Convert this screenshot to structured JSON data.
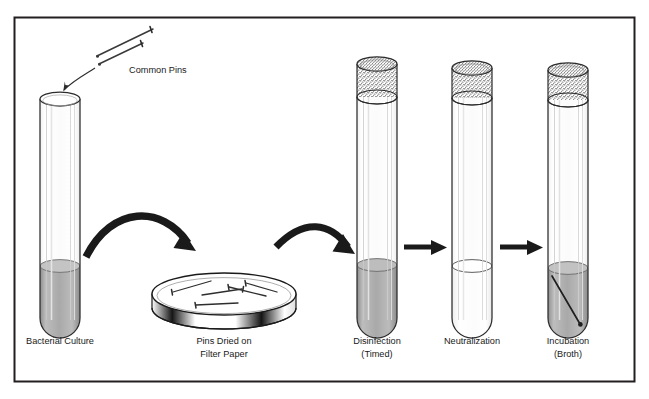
{
  "figure": {
    "border_color": "#231f20",
    "background_color": "#ffffff",
    "ink_color": "#231f20",
    "label_color": "#1a1a1a"
  },
  "labels": {
    "common_pins": "Common Pins",
    "bacterial_culture": "Bacterial Culture",
    "pins_dried_line1": "Pins Dried on",
    "pins_dried_line2": "Filter Paper",
    "disinfection_line1": "Disinfection",
    "disinfection_line2": "(Timed)",
    "neutralization": "Neutralization",
    "incubation_line1": "Incubation",
    "incubation_line2": "(Broth)"
  },
  "steps": [
    {
      "id": "bacterial-culture",
      "label": "Bacterial Culture",
      "vessel": "test-tube",
      "has_plug": false,
      "liquid": true,
      "liquid_color": "#b3b3b3",
      "liquid_level": "one-third",
      "has_pin_inside": false
    },
    {
      "id": "pins-dried",
      "label": "Pins Dried on Filter Paper",
      "vessel": "petri-dish",
      "pin_count": 5,
      "liquid": false
    },
    {
      "id": "disinfection",
      "label": "Disinfection (Timed)",
      "vessel": "test-tube",
      "has_plug": true,
      "liquid": true,
      "liquid_color": "#a8a8a8",
      "liquid_level": "one-third",
      "has_pin_inside": false
    },
    {
      "id": "neutralization",
      "label": "Neutralization",
      "vessel": "test-tube",
      "has_plug": true,
      "liquid": true,
      "liquid_color": "#fdfdfd",
      "liquid_level": "one-third",
      "has_pin_inside": false
    },
    {
      "id": "incubation",
      "label": "Incubation (Broth)",
      "vessel": "test-tube",
      "has_plug": true,
      "liquid": true,
      "liquid_color": "#b0b0b0",
      "liquid_level": "one-third",
      "has_pin_inside": true
    }
  ],
  "connectors": [
    {
      "id": "pins-to-tube",
      "type": "thin-curved-arrow",
      "from": "common-pins",
      "to": "bacterial-culture"
    },
    {
      "id": "tube-to-dish",
      "type": "thick-curved-arrow",
      "from": "bacterial-culture",
      "to": "pins-dried"
    },
    {
      "id": "dish-to-disinfection",
      "type": "thick-curved-arrow",
      "from": "pins-dried",
      "to": "disinfection"
    },
    {
      "id": "disinfection-to-neutralization",
      "type": "straight-arrow",
      "from": "disinfection",
      "to": "neutralization"
    },
    {
      "id": "neutralization-to-incubation",
      "type": "straight-arrow",
      "from": "neutralization",
      "to": "incubation"
    }
  ],
  "pins": {
    "free_pin_count": 2,
    "dish_pin_count": 5,
    "incubation_pin_count": 1
  }
}
